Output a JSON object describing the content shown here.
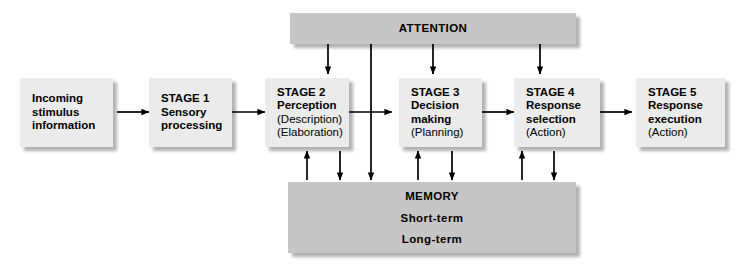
{
  "diagram": {
    "colors": {
      "box_fill": "#ebebeb",
      "bar_fill": "#c6c6c6",
      "stroke": "#000000",
      "background": "#ffffff"
    },
    "boxes": [
      {
        "id": "incoming",
        "lines": [
          "Incoming",
          "stimulus",
          "information"
        ],
        "bold": [
          true,
          true,
          true
        ]
      },
      {
        "id": "stage1",
        "lines": [
          "STAGE 1",
          "Sensory",
          "processing"
        ],
        "bold": [
          true,
          true,
          true
        ]
      },
      {
        "id": "stage2",
        "lines": [
          "STAGE 2",
          "Perception",
          "(Description)",
          "(Elaboration)"
        ],
        "bold": [
          true,
          true,
          false,
          false
        ]
      },
      {
        "id": "stage3",
        "lines": [
          "STAGE 3",
          "Decision",
          "making",
          "(Planning)"
        ],
        "bold": [
          true,
          true,
          true,
          false
        ]
      },
      {
        "id": "stage4",
        "lines": [
          "STAGE 4",
          "Response",
          "selection",
          "(Action)"
        ],
        "bold": [
          true,
          true,
          true,
          false
        ]
      },
      {
        "id": "stage5",
        "lines": [
          "STAGE 5",
          "Response",
          "execution",
          "(Action)"
        ],
        "bold": [
          true,
          true,
          true,
          false
        ]
      }
    ],
    "bars": [
      {
        "id": "attention",
        "labels": [
          "ATTENTION"
        ]
      },
      {
        "id": "memory",
        "labels": [
          "MEMORY",
          "Short-term",
          "Long-term"
        ]
      }
    ]
  }
}
